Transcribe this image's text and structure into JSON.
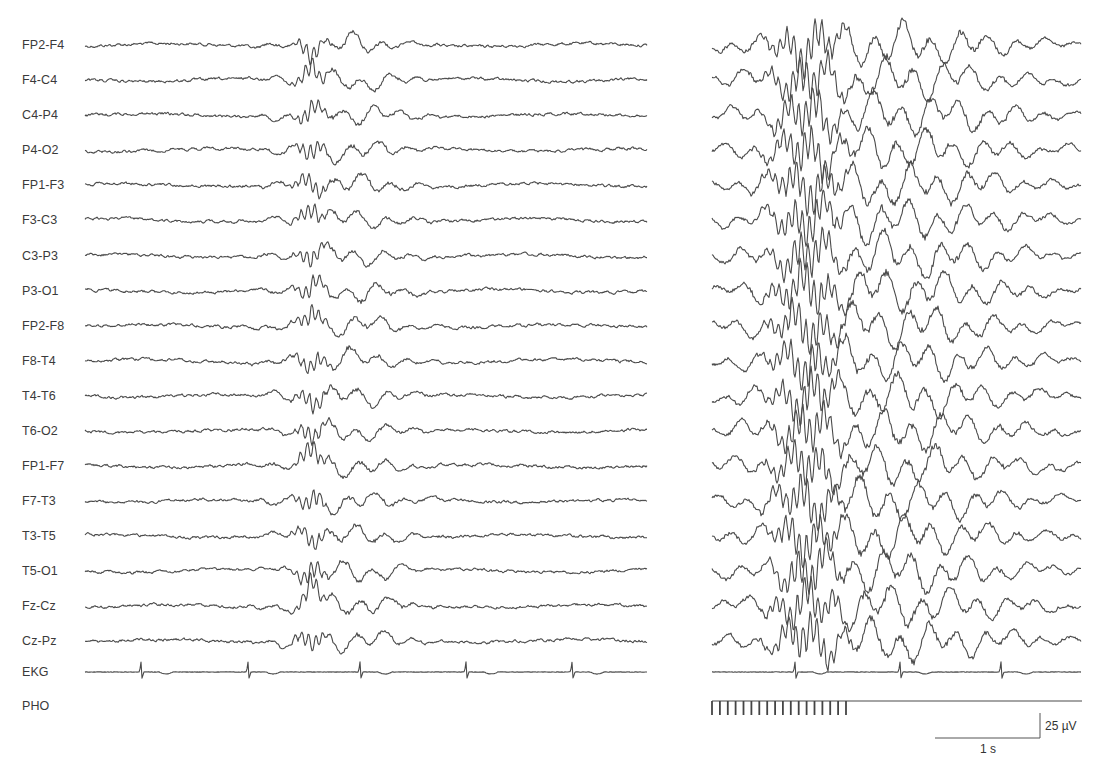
{
  "figure": {
    "type": "eeg_recording",
    "channels": [
      {
        "label": "FP2-F4",
        "y": 45
      },
      {
        "label": "F4-C4",
        "y": 80
      },
      {
        "label": "C4-P4",
        "y": 115
      },
      {
        "label": "P4-O2",
        "y": 150
      },
      {
        "label": "FP1-F3",
        "y": 185
      },
      {
        "label": "F3-C3",
        "y": 220
      },
      {
        "label": "C3-P3",
        "y": 256
      },
      {
        "label": "P3-O1",
        "y": 291
      },
      {
        "label": "FP2-F8",
        "y": 326
      },
      {
        "label": "F8-T4",
        "y": 361
      },
      {
        "label": "T4-T6",
        "y": 396
      },
      {
        "label": "T6-O2",
        "y": 431
      },
      {
        "label": "FP1-F7",
        "y": 466
      },
      {
        "label": "F7-T3",
        "y": 501
      },
      {
        "label": "T3-T5",
        "y": 536
      },
      {
        "label": "T5-O1",
        "y": 571
      },
      {
        "label": "Fz-Cz",
        "y": 606
      },
      {
        "label": "Cz-Pz",
        "y": 641
      },
      {
        "label": "EKG",
        "y": 672
      },
      {
        "label": "PHO",
        "y": 706
      }
    ],
    "scale_bar": {
      "amplitude_label": "25 µV",
      "time_label": "1 s"
    },
    "colors": {
      "trace": "#4a4a4a",
      "label": "#3a3a3a",
      "background": "#ffffff"
    }
  },
  "chart_data": {
    "type": "line",
    "title": "",
    "xlabel": "",
    "ylabel": "",
    "grid": false,
    "legend": "none",
    "panels": [
      {
        "name": "left",
        "x_range_px": [
          85,
          648
        ],
        "burst_center_px": 345,
        "burst_width_px": 120,
        "burst_amplitude": 0.8,
        "ekg_spikes_px": [
          141,
          248,
          360,
          466,
          572
        ],
        "photic_stimulation": false
      },
      {
        "name": "right",
        "x_range_px": [
          712,
          1082
        ],
        "burst_center_px": 880,
        "burst_width_px": 260,
        "burst_amplitude": 1.6,
        "ekg_spikes_px": [
          795,
          900,
          1001
        ],
        "photic_stimulation": true,
        "photic_ticks": 18,
        "photic_ticks_x_range_px": [
          712,
          846
        ]
      }
    ],
    "series": [
      "FP2-F4",
      "F4-C4",
      "C4-P4",
      "P4-O2",
      "FP1-F3",
      "F3-C3",
      "C3-P3",
      "P3-O1",
      "FP2-F8",
      "F8-T4",
      "T4-T6",
      "T6-O2",
      "FP1-F7",
      "F7-T3",
      "T3-T5",
      "T5-O1",
      "Fz-Cz",
      "Cz-Pz",
      "EKG",
      "PHO"
    ],
    "scale": {
      "amplitude_uV": 25,
      "time_s": 1,
      "amplitude_bar_px": 25,
      "time_bar_px": 105
    },
    "annotations": [
      "25 µV",
      "1 s"
    ]
  }
}
